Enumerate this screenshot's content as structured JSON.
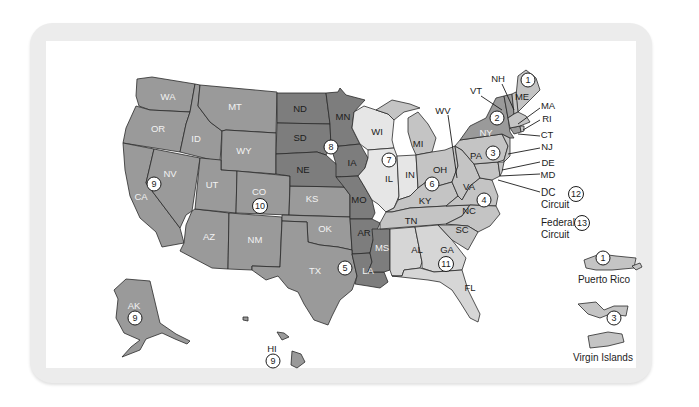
{
  "map": {
    "title": "U.S. Federal Judicial Circuits",
    "colors": {
      "frame": "#ececec",
      "background": "#ffffff",
      "shade_medium": "#9a9a9a",
      "shade_dark": "#7d7d7d",
      "shade_light": "#c4c4c4",
      "shade_pale": "#e6e6e6",
      "border": "#2a2a2a"
    },
    "states": [
      {
        "abbr": "WA",
        "circuit": 9
      },
      {
        "abbr": "OR",
        "circuit": 9
      },
      {
        "abbr": "CA",
        "circuit": 9
      },
      {
        "abbr": "NV",
        "circuit": 9
      },
      {
        "abbr": "ID",
        "circuit": 9
      },
      {
        "abbr": "MT",
        "circuit": 9
      },
      {
        "abbr": "AZ",
        "circuit": 9
      },
      {
        "abbr": "AK",
        "circuit": 9
      },
      {
        "abbr": "HI",
        "circuit": 9
      },
      {
        "abbr": "WY",
        "circuit": 10
      },
      {
        "abbr": "UT",
        "circuit": 10
      },
      {
        "abbr": "CO",
        "circuit": 10
      },
      {
        "abbr": "NM",
        "circuit": 10
      },
      {
        "abbr": "KS",
        "circuit": 10
      },
      {
        "abbr": "OK",
        "circuit": 10
      },
      {
        "abbr": "ND",
        "circuit": 8
      },
      {
        "abbr": "SD",
        "circuit": 8
      },
      {
        "abbr": "NE",
        "circuit": 8
      },
      {
        "abbr": "MN",
        "circuit": 8
      },
      {
        "abbr": "IA",
        "circuit": 8
      },
      {
        "abbr": "MO",
        "circuit": 8
      },
      {
        "abbr": "AR",
        "circuit": 8
      },
      {
        "abbr": "TX",
        "circuit": 5
      },
      {
        "abbr": "LA",
        "circuit": 5
      },
      {
        "abbr": "MS",
        "circuit": 5
      },
      {
        "abbr": "WI",
        "circuit": 7
      },
      {
        "abbr": "IL",
        "circuit": 7
      },
      {
        "abbr": "IN",
        "circuit": 7
      },
      {
        "abbr": "MI",
        "circuit": 6
      },
      {
        "abbr": "OH",
        "circuit": 6
      },
      {
        "abbr": "KY",
        "circuit": 6
      },
      {
        "abbr": "TN",
        "circuit": 6
      },
      {
        "abbr": "AL",
        "circuit": 11
      },
      {
        "abbr": "GA",
        "circuit": 11
      },
      {
        "abbr": "FL",
        "circuit": 11
      },
      {
        "abbr": "WV",
        "circuit": 4
      },
      {
        "abbr": "VA",
        "circuit": 4
      },
      {
        "abbr": "NC",
        "circuit": 4
      },
      {
        "abbr": "SC",
        "circuit": 4
      },
      {
        "abbr": "MD",
        "circuit": 4
      },
      {
        "abbr": "PA",
        "circuit": 3
      },
      {
        "abbr": "NJ",
        "circuit": 3
      },
      {
        "abbr": "DE",
        "circuit": 3
      },
      {
        "abbr": "NY",
        "circuit": 2
      },
      {
        "abbr": "VT",
        "circuit": 2
      },
      {
        "abbr": "CT",
        "circuit": 2
      },
      {
        "abbr": "ME",
        "circuit": 1
      },
      {
        "abbr": "NH",
        "circuit": 1
      },
      {
        "abbr": "MA",
        "circuit": 1
      },
      {
        "abbr": "RI",
        "circuit": 1
      }
    ],
    "labels": {
      "WA": "WA",
      "OR": "OR",
      "CA": "CA",
      "NV": "NV",
      "ID": "ID",
      "MT": "MT",
      "AZ": "AZ",
      "WY": "WY",
      "UT": "UT",
      "CO": "CO",
      "NM": "NM",
      "KS": "KS",
      "OK": "OK",
      "ND": "ND",
      "SD": "SD",
      "NE": "NE",
      "MN": "MN",
      "IA": "IA",
      "MO": "MO",
      "AR": "AR",
      "TX": "TX",
      "LA": "LA",
      "MS": "MS",
      "WI": "WI",
      "IL": "IL",
      "IN": "IN",
      "MI": "MI",
      "OH": "OH",
      "KY": "KY",
      "TN": "TN",
      "AL": "AL",
      "GA": "GA",
      "FL": "FL",
      "WV": "WV",
      "VA": "VA",
      "NC": "NC",
      "SC": "SC",
      "PA": "PA",
      "NY": "NY",
      "VT": "VT",
      "NH": "NH",
      "ME": "ME",
      "MA": "MA",
      "RI": "RI",
      "CT": "CT",
      "NJ": "NJ",
      "DE": "DE",
      "MD": "MD",
      "DC": "DC",
      "AK": "AK",
      "HI": "HI"
    },
    "circuit_badges": {
      "c1": "1",
      "c2": "2",
      "c3": "3",
      "c4": "4",
      "c5": "5",
      "c6": "6",
      "c7": "7",
      "c8": "8",
      "c9_west": "9",
      "c9_ak": "9",
      "c9_hi": "9",
      "c10": "10",
      "c11": "11",
      "c1_pr": "1",
      "c3_vi": "3"
    },
    "legend": {
      "dc_line1": "DC",
      "dc_line2": "Circuit",
      "dc_badge": "12",
      "fed_line1": "Federal",
      "fed_line2": "Circuit",
      "fed_badge": "13"
    },
    "territories": {
      "puerto_rico": "Puerto Rico",
      "virgin_islands": "Virgin Islands"
    }
  }
}
